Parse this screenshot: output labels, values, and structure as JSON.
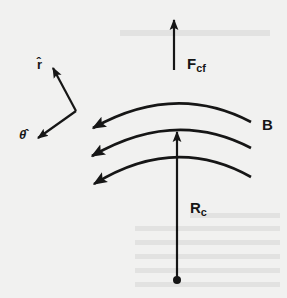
{
  "diagram": {
    "title": "",
    "colors": {
      "background": "#f1f1f0",
      "ink": "#161616"
    },
    "labels": {
      "centrifugal_force": {
        "main": "F",
        "sub": "cf"
      },
      "magnetic_field": "B",
      "curvature_radius": {
        "main": "R",
        "sub": "c"
      },
      "r_hat": "r̂",
      "theta_hat": "θ̂"
    },
    "elements": [
      {
        "id": "F_cf",
        "type": "arrow",
        "from": [
          174,
          70
        ],
        "to": [
          174,
          18
        ],
        "label": "F_cf"
      },
      {
        "id": "r_hat",
        "type": "arrow",
        "from": [
          76,
          111
        ],
        "to": [
          52,
          66
        ],
        "label": "r̂"
      },
      {
        "id": "theta_hat",
        "type": "arrow",
        "from": [
          76,
          111
        ],
        "to": [
          36,
          139
        ],
        "label": "θ̂"
      },
      {
        "id": "B_line_1",
        "type": "curved-arrow",
        "from": [
          251,
          122
        ],
        "to": [
          92,
          128
        ],
        "direction": "leftward",
        "label": "B"
      },
      {
        "id": "B_line_2",
        "type": "curved-arrow",
        "from": [
          251,
          148
        ],
        "to": [
          91,
          156
        ],
        "direction": "leftward"
      },
      {
        "id": "B_line_3",
        "type": "curved-arrow",
        "from": [
          251,
          177
        ],
        "to": [
          93,
          184
        ],
        "direction": "leftward"
      },
      {
        "id": "R_c",
        "type": "arrow",
        "from": [
          177,
          280
        ],
        "to": [
          177,
          130
        ],
        "label": "R_c",
        "origin": "center-of-curvature dot"
      }
    ]
  }
}
